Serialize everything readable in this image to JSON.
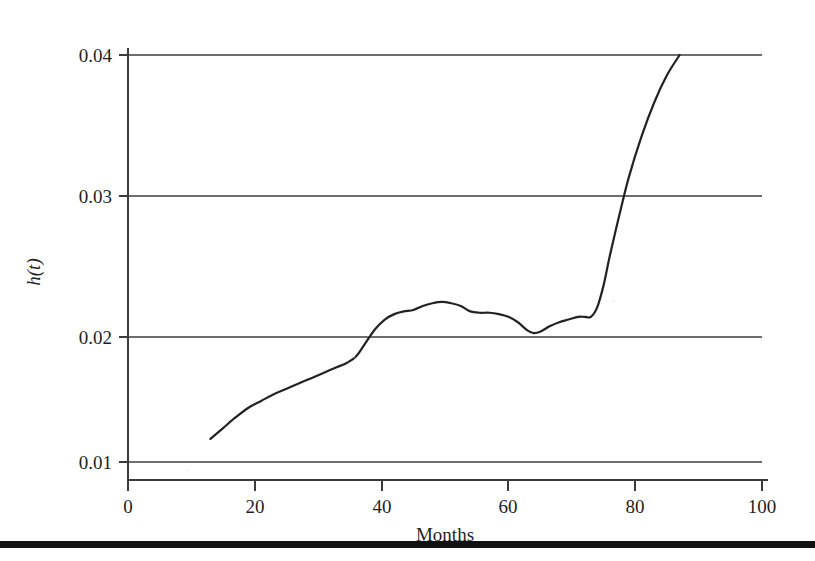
{
  "figure": {
    "background_color": "#ffffff",
    "ink_color": "#222222",
    "gridline_color": "#6e6e6e",
    "bottom_rule_color": "#111111"
  },
  "axes": {
    "y_title": "h(t)",
    "x_title": "Months",
    "y_tick_labels": [
      "0.04",
      "0.03",
      "0.02",
      "0.01"
    ],
    "x_tick_labels": [
      "0",
      "20",
      "40",
      "60",
      "80",
      "100"
    ]
  },
  "chart_data": {
    "type": "line",
    "title": "",
    "subtitle": "",
    "xlabel": "Months",
    "ylabel": "h(t)",
    "xlim": [
      0,
      100
    ],
    "ylim": [
      0.01,
      0.04
    ],
    "xticks": [
      0,
      20,
      40,
      60,
      80,
      100
    ],
    "yticks": [
      0.01,
      0.02,
      0.03,
      0.04
    ],
    "grid": true,
    "grid_axis": "y",
    "legend": false,
    "legend_position": "none",
    "annotations": [],
    "series": [
      {
        "name": "h(t)",
        "color": "#222222",
        "x": [
          13.0,
          15.0,
          17.0,
          19.0,
          21.0,
          23.0,
          25.0,
          27.0,
          29.0,
          31.0,
          33.0,
          34.5,
          36.0,
          37.5,
          39.0,
          40.5,
          42.0,
          43.5,
          45.0,
          46.5,
          48.0,
          49.5,
          51.0,
          52.5,
          54.0,
          55.5,
          57.0,
          58.5,
          60.0,
          61.5,
          63.0,
          64.0,
          65.0,
          66.5,
          68.0,
          69.5,
          71.0,
          72.0,
          73.0,
          74.0,
          75.0,
          76.0,
          77.5,
          79.0,
          81.0,
          83.0,
          85.0,
          87.0
        ],
        "y": [
          0.0117,
          0.0125,
          0.0133,
          0.014,
          0.0145,
          0.015,
          0.0154,
          0.0158,
          0.0162,
          0.0166,
          0.017,
          0.0173,
          0.0178,
          0.0188,
          0.0198,
          0.0205,
          0.0209,
          0.0211,
          0.0212,
          0.0215,
          0.0217,
          0.0218,
          0.0217,
          0.0215,
          0.0211,
          0.021,
          0.021,
          0.0209,
          0.0207,
          0.0203,
          0.0197,
          0.0195,
          0.0196,
          0.02,
          0.0203,
          0.0205,
          0.0207,
          0.0207,
          0.0207,
          0.0214,
          0.023,
          0.0252,
          0.0282,
          0.031,
          0.034,
          0.0365,
          0.0385,
          0.04
        ]
      }
    ]
  }
}
